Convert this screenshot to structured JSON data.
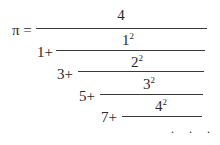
{
  "formula": {
    "lhs": "π =",
    "levels": [
      {
        "prefix": "",
        "numerator_base": "4",
        "numerator_exp": ""
      },
      {
        "prefix": "1+",
        "numerator_base": "1",
        "numerator_exp": "2"
      },
      {
        "prefix": "3+",
        "numerator_base": "2",
        "numerator_exp": "2"
      },
      {
        "prefix": "5+",
        "numerator_base": "3",
        "numerator_exp": "2"
      },
      {
        "prefix": "7+",
        "numerator_base": "4",
        "numerator_exp": "2"
      }
    ],
    "continuation": ". . ."
  }
}
